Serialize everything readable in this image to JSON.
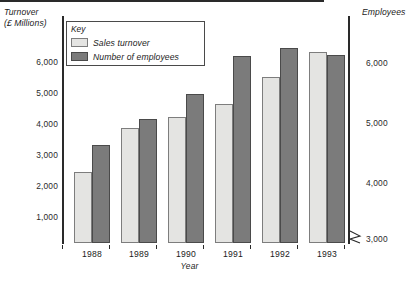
{
  "chart_data": {
    "type": "bar",
    "title": "",
    "categories": [
      "1988",
      "1989",
      "1990",
      "1991",
      "1992",
      "1993"
    ],
    "xlabel": "Year",
    "series": [
      {
        "name": "Sales turnover",
        "axis": "left",
        "color": "#e4e4e2",
        "values": [
          2550,
          3950,
          4250,
          4650,
          5400,
          6150
        ]
      },
      {
        "name": "Number of employees",
        "axis": "right",
        "color": "#7b7b7b",
        "values": [
          3300,
          4700,
          5100,
          6100,
          6250,
          6100
        ]
      }
    ],
    "left_axis": {
      "title": "Turnover\n(£ Millions)",
      "ylabel": "Turnover (£ Millions)",
      "ticks": [
        "1,000",
        "2,000",
        "3,000",
        "4,000",
        "5,000",
        "6,000"
      ],
      "tick_values": [
        1000,
        2000,
        3000,
        4000,
        5000,
        6000
      ],
      "ylim": [
        0,
        6500
      ]
    },
    "right_axis": {
      "title": "Employees",
      "ylabel": "Employees",
      "ticks": [
        "3,000",
        "4,000",
        "5,000",
        "6,000"
      ],
      "tick_values": [
        3000,
        4000,
        5000,
        6000
      ],
      "ylim": [
        3000,
        6500
      ],
      "axis_break": true
    },
    "legend": {
      "title": "Key",
      "position": "top-left-inside",
      "entries": [
        {
          "label": "Sales turnover",
          "color": "#e4e4e2"
        },
        {
          "label": "Number of employees",
          "color": "#7b7b7b"
        }
      ]
    },
    "grid": false
  },
  "axes": {
    "left_title": "Turnover\n(£ Millions)",
    "right_title": "Employees",
    "x_title": "Year"
  },
  "left_ticks": [
    {
      "label": "6,000",
      "top": 58
    },
    {
      "label": "5,000",
      "top": 89
    },
    {
      "label": "4,000",
      "top": 120
    },
    {
      "label": "3,000",
      "top": 151
    },
    {
      "label": "2,000",
      "top": 182
    },
    {
      "label": "1,000",
      "top": 213
    }
  ],
  "right_ticks": [
    {
      "label": "6,000",
      "top": 59
    },
    {
      "label": "5,000",
      "top": 119
    },
    {
      "label": "4,000",
      "top": 179
    },
    {
      "label": "3,000",
      "top": 235
    }
  ],
  "groups": [
    {
      "year": "1988",
      "light_top": 171.5,
      "dark_top": 145.0,
      "left": 74
    },
    {
      "year": "1989",
      "light_top": 128.0,
      "dark_top": 119.0,
      "left": 121
    },
    {
      "year": "1990",
      "light_top": 116.5,
      "dark_top": 94.0,
      "left": 168
    },
    {
      "year": "1991",
      "light_top": 103.5,
      "dark_top": 56.0,
      "left": 215
    },
    {
      "year": "1992",
      "light_top": 77.0,
      "dark_top": 48.0,
      "left": 262
    },
    {
      "year": "1993",
      "light_top": 51.5,
      "dark_top": 55.0,
      "left": 309
    }
  ],
  "base_ticks": [
    62,
    109,
    156,
    203,
    250,
    297,
    344
  ],
  "colors": {
    "light_fill": "#e4e4e2",
    "light_stroke": "#7d7d7d",
    "dark_fill": "#7b7b7b",
    "dark_stroke": "#4a4a4a",
    "axis": "#2a2a2a",
    "text": "#1b1b1b",
    "background": "#ffffff"
  }
}
